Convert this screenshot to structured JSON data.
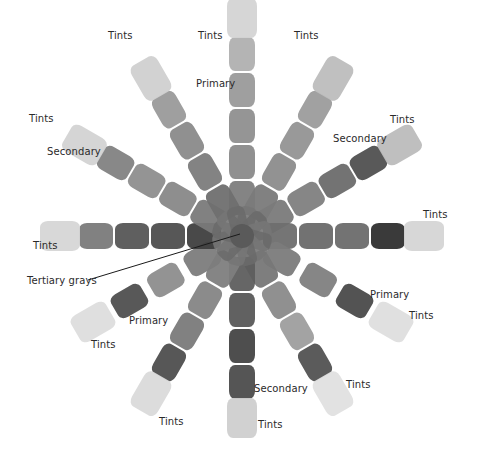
{
  "center_label": "Tertiary grays",
  "legend_terms": [
    "Primary",
    "Secondary",
    "Tints",
    "Tertiary grays"
  ],
  "spokes": [
    {
      "id": "spoke-n",
      "role": "Primary",
      "labels": [
        {
          "text": "Tints"
        },
        {
          "text": "Primary"
        }
      ],
      "swatches": [
        "#7d7d7d",
        "#8a8a8a",
        "#8f8f8f",
        "#9a9a9a",
        "#b0b0b0",
        "#d4d4d4"
      ]
    },
    {
      "id": "spoke-nne",
      "role": "Tints",
      "labels": [
        {
          "text": "Tints"
        }
      ],
      "swatches": [
        "#7a7a7a",
        "#8c8c8c",
        "#939393",
        "#9c9c9c",
        "#bdbdbd"
      ]
    },
    {
      "id": "spoke-ene",
      "role": "Secondary",
      "labels": [
        {
          "text": "Secondary"
        },
        {
          "text": "Tints"
        }
      ],
      "swatches": [
        "#7a7a7a",
        "#7f7f7f",
        "#6c6c6c",
        "#505050",
        "#bcbcbc"
      ]
    },
    {
      "id": "spoke-e",
      "role": "Tints",
      "labels": [
        {
          "text": "Tints"
        }
      ],
      "swatches": [
        "#6e6e6e",
        "#6a6a6a",
        "#6c6c6c",
        "#2f2f2f",
        "#d5d5d5"
      ]
    },
    {
      "id": "spoke-ese",
      "role": "Primary",
      "labels": [
        {
          "text": "Primary"
        },
        {
          "text": "Tints"
        }
      ],
      "swatches": [
        "#7b7b7b",
        "#808080",
        "#4a4a4a",
        "#dedede"
      ]
    },
    {
      "id": "spoke-sse",
      "role": "Tints",
      "labels": [
        {
          "text": "Tints"
        }
      ],
      "swatches": [
        "#777777",
        "#8a8a8a",
        "#9e9e9e",
        "#525252",
        "#e0e0e0"
      ]
    },
    {
      "id": "spoke-s",
      "role": "Secondary",
      "labels": [
        {
          "text": "Secondary"
        },
        {
          "text": "Tints"
        }
      ],
      "swatches": [
        "#5e5e5e",
        "#585858",
        "#454545",
        "#4c4c4c",
        "#cfcfcf"
      ]
    },
    {
      "id": "spoke-ssw",
      "role": "Tints",
      "labels": [
        {
          "text": "Tints"
        }
      ],
      "swatches": [
        "#7e7e7e",
        "#858585",
        "#7a7a7a",
        "#4e4e4e",
        "#dadada"
      ]
    },
    {
      "id": "spoke-wsw",
      "role": "Primary",
      "labels": [
        {
          "text": "Primary"
        },
        {
          "text": "Tints"
        }
      ],
      "swatches": [
        "#7c7c7c",
        "#8d8d8d",
        "#4f4f4f",
        "#dddddd"
      ]
    },
    {
      "id": "spoke-w",
      "role": "Tints",
      "labels": [
        {
          "text": "Tints"
        }
      ],
      "swatches": [
        "#3f3f3f",
        "#4e4e4e",
        "#565656",
        "#7a7a7a",
        "#d6d6d6"
      ]
    },
    {
      "id": "spoke-wnw",
      "role": "Secondary",
      "labels": [
        {
          "text": "Secondary"
        },
        {
          "text": "Tints"
        }
      ],
      "swatches": [
        "#7a7a7a",
        "#888888",
        "#8e8e8e",
        "#828282",
        "#d3d3d3"
      ]
    },
    {
      "id": "spoke-nnw",
      "role": "Tints",
      "labels": [
        {
          "text": "Tints"
        }
      ],
      "swatches": [
        "#6f6f6f",
        "#7c7c7c",
        "#8a8a8a",
        "#9a9a9a",
        "#d0d0d0"
      ]
    }
  ],
  "colors": {
    "background": "#ffffff",
    "label_text": "#2a2a2a",
    "leader_line": "#1a1a1a",
    "center": "#5a5a5a"
  }
}
